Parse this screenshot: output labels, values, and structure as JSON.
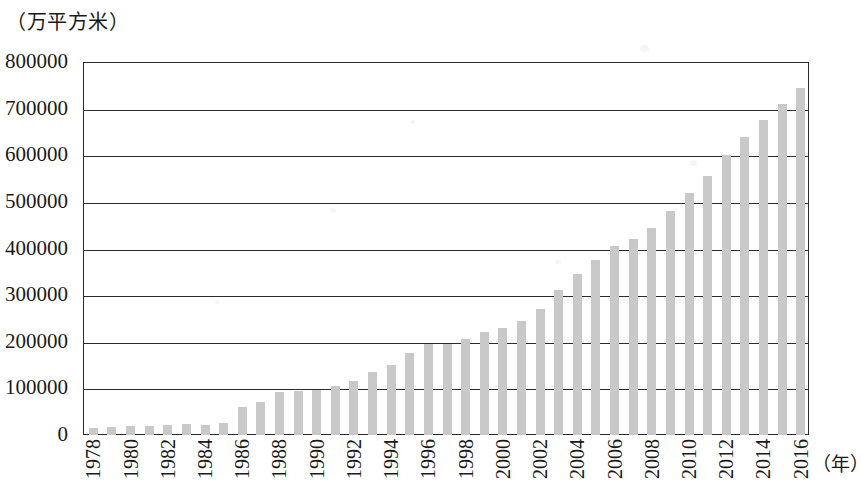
{
  "chart_data": {
    "type": "bar",
    "title": "",
    "subtitle": "",
    "ylabel": "（万平方米）",
    "xlabel": "（年）",
    "ylim": [
      0,
      800000
    ],
    "ytick_step": 100000,
    "ytick_labels": [
      "800000",
      "700000",
      "600000",
      "500000",
      "400000",
      "300000",
      "200000",
      "100000",
      "0"
    ],
    "ytick_values": [
      800000,
      700000,
      600000,
      500000,
      400000,
      300000,
      200000,
      100000,
      0
    ],
    "grid": true,
    "legend": null,
    "bar_color": "#c9c9c9",
    "axis_color": "#2b2b2b",
    "xtick_label_rotation": 90,
    "xtick_labels_shown": [
      "1978",
      "1980",
      "1982",
      "1984",
      "1986",
      "1988",
      "1990",
      "1992",
      "1994",
      "1996",
      "1998",
      "2000",
      "2002",
      "2004",
      "2006",
      "2008",
      "2010",
      "2012",
      "2014",
      "2016"
    ],
    "categories": [
      "1978",
      "1979",
      "1980",
      "1981",
      "1982",
      "1983",
      "1984",
      "1985",
      "1986",
      "1987",
      "1988",
      "1989",
      "1990",
      "1991",
      "1992",
      "1993",
      "1994",
      "1995",
      "1996",
      "1997",
      "1998",
      "1999",
      "2000",
      "2001",
      "2002",
      "2003",
      "2004",
      "2005",
      "2006",
      "2007",
      "2008",
      "2009",
      "2010",
      "2011",
      "2012",
      "2013",
      "2014",
      "2015",
      "2016"
    ],
    "values": [
      16000,
      17000,
      19000,
      20000,
      22000,
      23000,
      22000,
      26000,
      60000,
      70000,
      92000,
      94000,
      96000,
      105000,
      115000,
      135000,
      150000,
      175000,
      195000,
      196000,
      205000,
      220000,
      230000,
      245000,
      270000,
      310000,
      345000,
      375000,
      405000,
      420000,
      445000,
      480000,
      520000,
      555000,
      600000,
      640000,
      675000,
      710000,
      745000
    ]
  }
}
